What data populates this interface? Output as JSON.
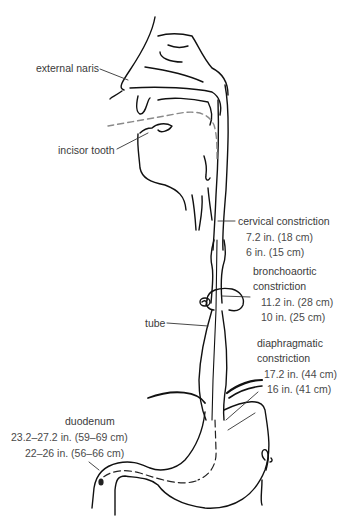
{
  "diagram": {
    "colors": {
      "line": "#111111",
      "label_text": "#3a3a3a",
      "tube_dash": "#8a8a8a",
      "background": "#ffffff"
    },
    "labels": {
      "external_naris": "external naris",
      "incisor_tooth": "incisor tooth",
      "cervical": {
        "title": "cervical constriction",
        "adult": "7.2 in. (18 cm)",
        "child": "6 in. (15 cm)"
      },
      "bronchoaortic": {
        "title_line1": "bronchoaortic",
        "title_line2": "constriction",
        "adult": "11.2 in. (28 cm)",
        "child": "10 in. (25 cm)"
      },
      "tube": "tube",
      "diaphragmatic": {
        "title_line1": "diaphragmatic",
        "title_line2": "constriction",
        "adult": "17.2 in. (44 cm)",
        "child": "16 in. (41 cm)"
      },
      "duodenum": {
        "title": "duodenum",
        "adult": "23.2–27.2 in. (59–69 cm)",
        "child": "22–26 in. (56–66 cm)"
      }
    }
  }
}
